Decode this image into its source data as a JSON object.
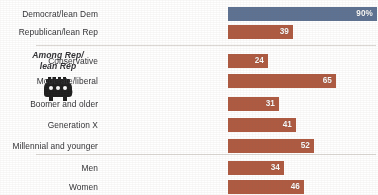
{
  "side_note": {
    "line1": "Among Rep/",
    "line2": "lean Rep",
    "icon": "gop-elephant-icon"
  },
  "colors": {
    "democrat": "#5b7296",
    "republican": "#b5583c",
    "label_text": "#2f2f33",
    "value_text": "#ffffff",
    "divider": "#d8d4cf",
    "background": "#ffffff"
  },
  "chart_data": {
    "type": "bar",
    "orientation": "horizontal",
    "title": "",
    "xlabel": "",
    "ylabel": "",
    "xlim": [
      0,
      90
    ],
    "grid": false,
    "legend": "none",
    "categories": [
      "Democrat/lean Dem",
      "Republican/lean Rep",
      "Conservative",
      "Moderate/liberal",
      "Boomer and older",
      "Generation X",
      "Millennial and younger",
      "Men",
      "Women"
    ],
    "values": [
      90,
      39,
      24,
      65,
      31,
      41,
      52,
      34,
      46
    ],
    "value_labels": [
      "90%",
      "39",
      "24",
      "65",
      "31",
      "41",
      "52",
      "34",
      "46"
    ],
    "series_colors": [
      "#5b7296",
      "#b5583c",
      "#b5583c",
      "#b5583c",
      "#b5583c",
      "#b5583c",
      "#b5583c",
      "#b5583c",
      "#b5583c"
    ],
    "groups": [
      {
        "name": "Party",
        "rows": [
          0,
          1
        ]
      },
      {
        "name": "Among Rep/lean Rep",
        "rows": [
          2,
          3,
          4,
          5,
          6
        ]
      },
      {
        "name": "Gender",
        "rows": [
          7,
          8
        ]
      }
    ]
  },
  "rows": [
    {
      "label": "Democrat/lean Dem",
      "value": 90,
      "value_label": "90%",
      "color_key": "dem",
      "top": 6
    },
    {
      "label": "Republican/lean Rep",
      "value": 39,
      "value_label": "39",
      "color_key": "rep",
      "top": 24
    },
    {
      "label": "Conservative",
      "value": 24,
      "value_label": "24",
      "color_key": "rep",
      "top": 53
    },
    {
      "label": "Moderate/liberal",
      "value": 65,
      "value_label": "65",
      "color_key": "rep",
      "top": 73
    },
    {
      "label": "Boomer and older",
      "value": 31,
      "value_label": "31",
      "color_key": "rep",
      "top": 96
    },
    {
      "label": "Generation X",
      "value": 41,
      "value_label": "41",
      "color_key": "rep",
      "top": 117
    },
    {
      "label": "Millennial and younger",
      "value": 52,
      "value_label": "52",
      "color_key": "rep",
      "top": 138
    },
    {
      "label": "Men",
      "value": 34,
      "value_label": "34",
      "color_key": "rep",
      "top": 160
    },
    {
      "label": "Women",
      "value": 46,
      "value_label": "46",
      "color_key": "rep",
      "top": 179
    }
  ]
}
